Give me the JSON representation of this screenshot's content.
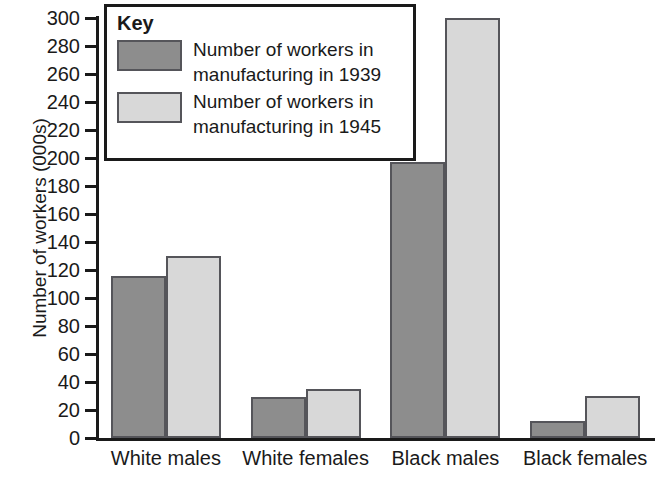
{
  "chart_data": {
    "type": "bar",
    "title": "",
    "xlabel": "",
    "ylabel": "Number of workers (000s)",
    "ylim": [
      0,
      300
    ],
    "ytick_step": 20,
    "grid": false,
    "legend_position": "inside-top-left",
    "categories": [
      "White males",
      "White females",
      "Black males",
      "Black females"
    ],
    "series": [
      {
        "name": "Number of workers in manufacturing in 1939",
        "color": "#8d8d8d",
        "values": [
          116,
          29,
          197,
          12
        ]
      },
      {
        "name": "Number of workers in manufacturing in 1945",
        "color": "#d8d8d8",
        "values": [
          130,
          35,
          300,
          30
        ]
      }
    ],
    "yticks": [
      0,
      20,
      40,
      60,
      80,
      100,
      120,
      140,
      160,
      180,
      200,
      220,
      240,
      260,
      280,
      300
    ]
  },
  "legend": {
    "title": "Key",
    "entries": [
      {
        "label": "Number of workers in\nmanufacturing in 1939",
        "color": "#8d8d8d"
      },
      {
        "label": "Number of workers in\nmanufacturing in 1945",
        "color": "#d8d8d8"
      }
    ]
  },
  "axis": {
    "y_title": "Number of workers (000s)"
  }
}
